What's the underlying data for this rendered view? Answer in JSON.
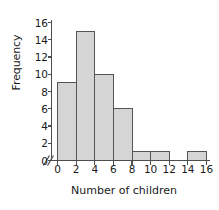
{
  "chart_data": {
    "type": "bar",
    "title": "",
    "xlabel": "Number of children",
    "ylabel": "Frequency",
    "categories": [
      "0-2",
      "2-4",
      "4-6",
      "6-8",
      "8-10",
      "10-12",
      "12-14",
      "14-16"
    ],
    "bin_edges": [
      0,
      2,
      4,
      6,
      8,
      10,
      12,
      14,
      16
    ],
    "values": [
      9,
      15,
      10,
      6,
      1,
      1,
      0,
      1
    ],
    "xlim": [
      0,
      16
    ],
    "ylim": [
      0,
      16
    ],
    "xticks": [
      0,
      2,
      4,
      6,
      8,
      10,
      12,
      14,
      16
    ],
    "yticks": [
      0,
      2,
      4,
      6,
      8,
      10,
      12,
      14,
      16
    ],
    "xtick_labels": [
      "0",
      "2",
      "4",
      "6",
      "8",
      "10",
      "12",
      "14",
      "16"
    ],
    "ytick_labels": [
      "0",
      "2",
      "4",
      "6",
      "8",
      "10",
      "12",
      "14",
      "16"
    ],
    "grid": false,
    "legend": null,
    "axis_break": "//",
    "bar_fill_color": "#d5d5d5",
    "bar_edge_color": "#555555",
    "axis_color": "#4d4d4d",
    "background_color": "#ffffff"
  }
}
